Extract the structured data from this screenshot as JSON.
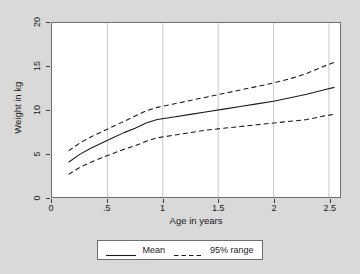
{
  "chart_data": {
    "type": "line",
    "title": "",
    "xlabel": "Age in years",
    "ylabel": "Weight in kg",
    "xlim": [
      0,
      2.6
    ],
    "ylim": [
      0,
      20
    ],
    "xticks": [
      "0",
      ".5",
      "1",
      "1.5",
      "2",
      "2.5"
    ],
    "xtick_values": [
      0,
      0.5,
      1,
      1.5,
      2,
      2.5
    ],
    "yticks": [
      "0",
      "5",
      "10",
      "15",
      "20"
    ],
    "ytick_values": [
      0,
      5,
      10,
      15,
      20
    ],
    "grid": "vertical-at-x-ticks",
    "legend_position": "below-plot",
    "x": [
      0.15,
      0.25,
      0.35,
      0.45,
      0.55,
      0.65,
      0.75,
      0.85,
      0.95,
      1.1,
      1.25,
      1.4,
      1.55,
      1.7,
      1.85,
      2.0,
      2.15,
      2.3,
      2.45,
      2.55
    ],
    "series": [
      {
        "name": "Mean",
        "style": "solid",
        "color": "#1a1a1a",
        "values": [
          4.0,
          4.9,
          5.6,
          6.2,
          6.8,
          7.4,
          7.9,
          8.5,
          8.9,
          9.2,
          9.5,
          9.8,
          10.1,
          10.4,
          10.7,
          11.0,
          11.4,
          11.8,
          12.3,
          12.6
        ]
      },
      {
        "name": "95% upper",
        "style": "dashed",
        "color": "#1a1a1a",
        "values": [
          5.3,
          6.2,
          6.9,
          7.5,
          8.1,
          8.7,
          9.3,
          9.9,
          10.3,
          10.7,
          11.1,
          11.5,
          11.9,
          12.3,
          12.7,
          13.1,
          13.6,
          14.2,
          15.0,
          15.5
        ]
      },
      {
        "name": "95% lower",
        "style": "dashed",
        "color": "#1a1a1a",
        "values": [
          2.6,
          3.4,
          4.0,
          4.5,
          5.0,
          5.5,
          5.9,
          6.4,
          6.8,
          7.1,
          7.4,
          7.7,
          7.9,
          8.1,
          8.3,
          8.5,
          8.7,
          8.9,
          9.3,
          9.5
        ]
      }
    ],
    "legend": [
      {
        "label": "Mean",
        "style": "solid"
      },
      {
        "label": "95% range",
        "style": "dashed"
      }
    ]
  }
}
